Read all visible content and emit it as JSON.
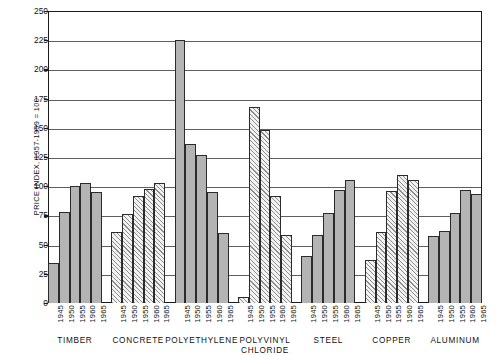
{
  "chart_data": {
    "type": "bar",
    "title": "",
    "subtitle": "",
    "xlabel": "",
    "ylabel": "PRICE INDEX, 1957-1959 = 100",
    "ylim": [
      0,
      250
    ],
    "ytick_labels": [
      "250",
      "225",
      "200",
      "175",
      "150",
      "125",
      "100",
      "75",
      "50",
      "25",
      "0"
    ],
    "ytick_values": [
      250,
      225,
      200,
      175,
      150,
      125,
      100,
      75,
      50,
      25,
      0
    ],
    "grid": true,
    "legend": "none",
    "categories": [
      "1945",
      "1950",
      "1955",
      "1960",
      "1965"
    ],
    "groups": [
      {
        "name": "TIMBER",
        "fill": "solid",
        "values": [
          34,
          78,
          100,
          103,
          95
        ]
      },
      {
        "name": "CONCRETE",
        "fill": "hatch",
        "values": [
          61,
          76,
          92,
          98,
          103
        ]
      },
      {
        "name": "POLYETHYLENE",
        "fill": "solid",
        "values": [
          225,
          136,
          127,
          95,
          60
        ]
      },
      {
        "name": "POLYVINYL\nCHLORIDE",
        "fill": "hatch",
        "values": [
          5,
          168,
          148,
          92,
          58
        ]
      },
      {
        "name": "STEEL",
        "fill": "solid",
        "values": [
          40,
          58,
          77,
          97,
          105
        ]
      },
      {
        "name": "COPPER",
        "fill": "hatch",
        "values": [
          37,
          61,
          96,
          110,
          105
        ]
      },
      {
        "name": "ALUMINUM",
        "fill": "solid",
        "values": [
          57,
          62,
          77,
          97,
          93
        ]
      }
    ]
  },
  "colors": {
    "axis": "#1a1a1a",
    "grid": "#5e5e5e",
    "bar_solid": "#b4b4b4",
    "bar_hatch_line": "#8d8d8d",
    "bar_border": "#2b2b2b",
    "background": "#ffffff"
  }
}
